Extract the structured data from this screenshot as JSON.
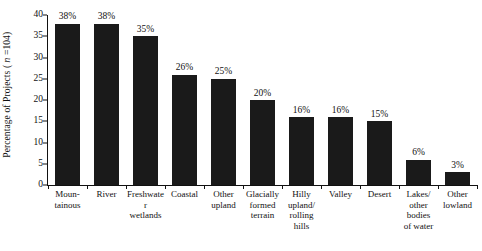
{
  "chart_data": {
    "type": "bar",
    "title": "",
    "xlabel": "",
    "ylabel": "Percentage of Projects (n = 104)",
    "ylabel_prefix": "Percentage of Projects ( ",
    "ylabel_italic": "n",
    "ylabel_suffix": " =104)",
    "ylim": [
      0,
      40
    ],
    "ytick_step": 5,
    "yticks": [
      "40",
      "35",
      "30",
      "25",
      "20",
      "15",
      "10",
      "5",
      "0"
    ],
    "ytick_values": [
      40,
      35,
      30,
      25,
      20,
      15,
      10,
      5,
      0
    ],
    "grid": false,
    "legend": "none",
    "sample_size": 104,
    "units": "percent",
    "bar_color": "#1a1a1a",
    "axis_color": "#111111",
    "background": "#ffffff",
    "categories": [
      "Moun-\ntainous",
      "River",
      "Freshwater\nwetlands",
      "Coastal",
      "Other\nupland",
      "Glacially\nformed\nterrain",
      "Hilly\nupland/\nrolling\nhills",
      "Valley",
      "Desert",
      "Lakes/\nother\nbodies\nof water",
      "Other\nlowland"
    ],
    "category_lines": [
      [
        "Moun-",
        "tainous"
      ],
      [
        "River"
      ],
      [
        "Freshwater",
        "wetlands"
      ],
      [
        "Coastal"
      ],
      [
        "Other",
        "upland"
      ],
      [
        "Glacially",
        "formed",
        "terrain"
      ],
      [
        "Hilly",
        "upland/",
        "rolling",
        "hills"
      ],
      [
        "Valley"
      ],
      [
        "Desert"
      ],
      [
        "Lakes/",
        "other",
        "bodies",
        "of water"
      ],
      [
        "Other",
        "lowland"
      ]
    ],
    "values": [
      38,
      38,
      35,
      26,
      25,
      20,
      16,
      16,
      15,
      6,
      3
    ],
    "value_labels": [
      "38%",
      "38%",
      "35%",
      "26%",
      "25%",
      "20%",
      "16%",
      "16%",
      "15%",
      "6%",
      "3%"
    ]
  }
}
